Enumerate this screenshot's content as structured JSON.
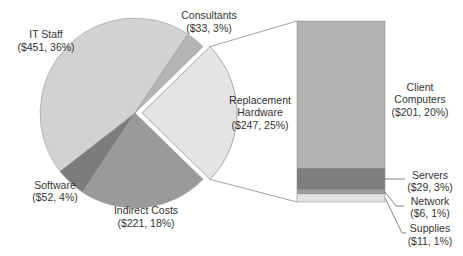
{
  "chart_data": {
    "type": "pie",
    "subtype": "bar-of-pie",
    "title": "",
    "pie": {
      "slices": [
        {
          "name": "Replacement Hardware",
          "value": 247,
          "percent": 25,
          "label_line1": "Replacement",
          "label_line2": "Hardware",
          "label_value": "($247, 25%)",
          "color": "#e4e4e4",
          "exploded": true
        },
        {
          "name": "Indirect Costs",
          "value": 221,
          "percent": 18,
          "label_line1": "Indirect Costs",
          "label_value": "($221, 18%)",
          "color": "#9a9a9a"
        },
        {
          "name": "Software",
          "value": 52,
          "percent": 4,
          "label_line1": "Software",
          "label_value": "($52, 4%)",
          "color": "#7c7c7c"
        },
        {
          "name": "IT Staff",
          "value": 451,
          "percent": 36,
          "label_line1": "IT Staff",
          "label_value": "($451, 36%)",
          "color": "#d2d2d2"
        },
        {
          "name": "Consultants",
          "value": 33,
          "percent": 3,
          "label_line1": "Consultants",
          "label_value": "($33, 3%)",
          "color": "#b4b4b4"
        }
      ]
    },
    "bar": {
      "parent": "Replacement Hardware",
      "segments": [
        {
          "name": "Client Computers",
          "value": 201,
          "percent": 20,
          "label_line1": "Client",
          "label_line2": "Computers",
          "label_value": "($201, 20%)",
          "color": "#b2b2b2"
        },
        {
          "name": "Servers",
          "value": 29,
          "percent": 3,
          "label_line1": "Servers",
          "label_value": "($29, 3%)",
          "color": "#7e7e7e"
        },
        {
          "name": "Network",
          "value": 6,
          "percent": 1,
          "label_line1": "Network",
          "label_value": "($6, 1%)",
          "color": "#9c9c9c"
        },
        {
          "name": "Supplies",
          "value": 11,
          "percent": 1,
          "label_line1": "Supplies",
          "label_value": "($11, 1%)",
          "color": "#e2e2e2"
        }
      ]
    },
    "legend": "none",
    "grid": false
  }
}
